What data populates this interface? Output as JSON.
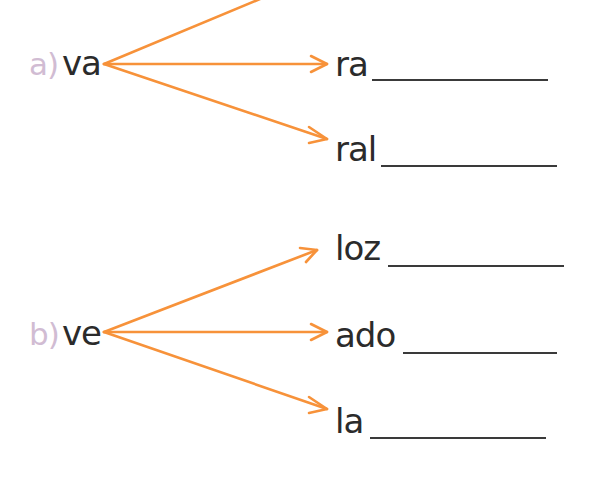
{
  "colors": {
    "arrow": "#f7923a",
    "label": "#d1bcd3",
    "text": "#2b2b2b",
    "line": "#3a3a3a"
  },
  "exercises": [
    {
      "label": "a)",
      "stem": "va",
      "endings": [
        {
          "text": "",
          "answer": ""
        },
        {
          "text": "ra",
          "answer": ""
        },
        {
          "text": "ral",
          "answer": ""
        }
      ]
    },
    {
      "label": "b)",
      "stem": "ve",
      "endings": [
        {
          "text": "loz",
          "answer": ""
        },
        {
          "text": "ado",
          "answer": ""
        },
        {
          "text": "la",
          "answer": ""
        }
      ]
    }
  ]
}
